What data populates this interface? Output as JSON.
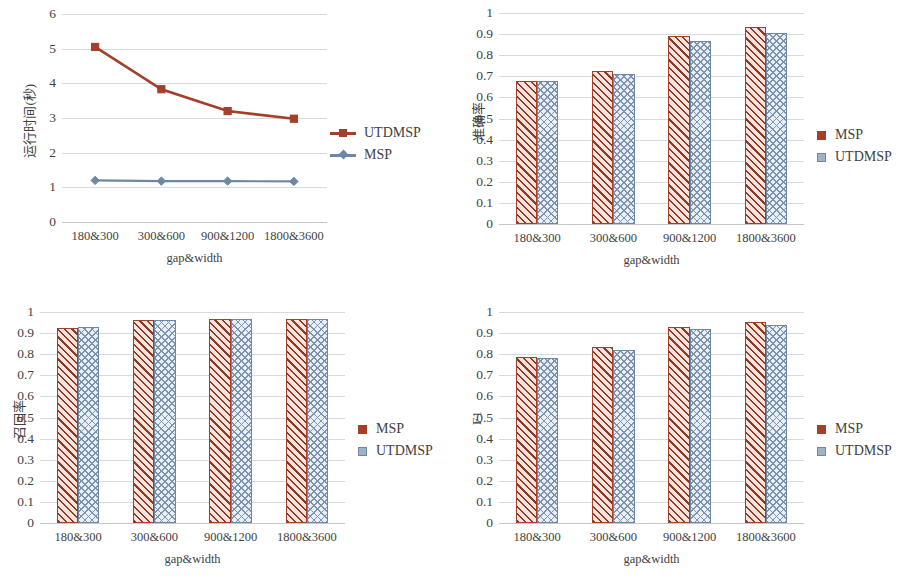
{
  "colors": {
    "msp_line": "#a33f2a",
    "msp_fill": "#f6e3dd",
    "utdmsp_line": "#6f87a3",
    "utdmsp_fill": "#e9eff7",
    "gridline": "#d6d9de",
    "text": "#3f3f3f"
  },
  "shared": {
    "categories": [
      "180&300",
      "300&600",
      "900&1200",
      "1800&3600"
    ],
    "xlabel": "gap&width",
    "series_names": {
      "msp": "MSP",
      "utdmsp": "UTDMSP"
    }
  },
  "charts": [
    {
      "id": "runtime",
      "type": "line",
      "title": "",
      "ylabel": "运行时间(秒)",
      "xlabel": "gap&width",
      "categories": [
        "180&300",
        "300&600",
        "900&1200",
        "1800&3600"
      ],
      "yticks": [
        "0",
        "1",
        "2",
        "3",
        "4",
        "5",
        "6"
      ],
      "ylim": [
        0,
        6
      ],
      "grid": true,
      "legend_position": "right",
      "series": [
        {
          "name": "UTDMSP",
          "color": "#a33f2a",
          "marker": "square",
          "values": [
            5.05,
            3.83,
            3.2,
            2.98
          ]
        },
        {
          "name": "MSP",
          "color": "#6f87a3",
          "marker": "diamond",
          "values": [
            1.2,
            1.18,
            1.18,
            1.17
          ]
        }
      ]
    },
    {
      "id": "precision",
      "type": "bar",
      "title": "",
      "ylabel": "准确率",
      "xlabel": "gap&width",
      "categories": [
        "180&300",
        "300&600",
        "900&1200",
        "1800&3600"
      ],
      "yticks": [
        "0",
        "0.1",
        "0.2",
        "0.3",
        "0.4",
        "0.5",
        "0.6",
        "0.7",
        "0.8",
        "0.9",
        "1"
      ],
      "ylim": [
        0,
        1
      ],
      "grid": true,
      "legend_position": "right",
      "series": [
        {
          "name": "MSP",
          "color": "#a33f2a",
          "pattern": "diagonal-hatch",
          "values": [
            0.68,
            0.723,
            0.889,
            0.935
          ]
        },
        {
          "name": "UTDMSP",
          "color": "#6f87a3",
          "pattern": "cross-hatch",
          "values": [
            0.676,
            0.71,
            0.866,
            0.905
          ]
        }
      ]
    },
    {
      "id": "recall",
      "type": "bar",
      "title": "",
      "ylabel": "召回率",
      "xlabel": "gap&width",
      "categories": [
        "180&300",
        "300&600",
        "900&1200",
        "1800&3600"
      ],
      "yticks": [
        "0",
        "0.1",
        "0.2",
        "0.3",
        "0.4",
        "0.5",
        "0.6",
        "0.7",
        "0.8",
        "0.9",
        "1"
      ],
      "ylim": [
        0,
        1
      ],
      "grid": true,
      "legend_position": "right",
      "series": [
        {
          "name": "MSP",
          "color": "#a33f2a",
          "pattern": "diagonal-hatch",
          "values": [
            0.925,
            0.962,
            0.968,
            0.966
          ]
        },
        {
          "name": "UTDMSP",
          "color": "#6f87a3",
          "pattern": "cross-hatch",
          "values": [
            0.927,
            0.961,
            0.967,
            0.966
          ]
        }
      ]
    },
    {
      "id": "f1",
      "type": "bar",
      "title": "",
      "ylabel": "F1",
      "xlabel": "gap&width",
      "categories": [
        "180&300",
        "300&600",
        "900&1200",
        "1800&3600"
      ],
      "yticks": [
        "0",
        "0.1",
        "0.2",
        "0.3",
        "0.4",
        "0.5",
        "0.6",
        "0.7",
        "0.8",
        "0.9",
        "1"
      ],
      "ylim": [
        0,
        1
      ],
      "grid": true,
      "legend_position": "right",
      "series": [
        {
          "name": "MSP",
          "color": "#a33f2a",
          "pattern": "diagonal-hatch",
          "values": [
            0.785,
            0.834,
            0.929,
            0.954
          ]
        },
        {
          "name": "UTDMSP",
          "color": "#6f87a3",
          "pattern": "cross-hatch",
          "values": [
            0.781,
            0.821,
            0.918,
            0.938
          ]
        }
      ]
    }
  ],
  "chart_data": [
    {
      "type": "line",
      "title": "运行时间(秒) vs gap&width",
      "xlabel": "gap&width",
      "ylabel": "运行时间(秒)",
      "categories": [
        "180&300",
        "300&600",
        "900&1200",
        "1800&3600"
      ],
      "ylim": [
        0,
        6
      ],
      "yticks": [
        0,
        1,
        2,
        3,
        4,
        5,
        6
      ],
      "grid": true,
      "legend": [
        "UTDMSP",
        "MSP"
      ],
      "legend_position": "right",
      "series": [
        {
          "name": "UTDMSP",
          "values": [
            5.05,
            3.83,
            3.2,
            2.98
          ]
        },
        {
          "name": "MSP",
          "values": [
            1.2,
            1.18,
            1.18,
            1.17
          ]
        }
      ]
    },
    {
      "type": "bar",
      "title": "准确率 vs gap&width",
      "xlabel": "gap&width",
      "ylabel": "准确率",
      "categories": [
        "180&300",
        "300&600",
        "900&1200",
        "1800&3600"
      ],
      "ylim": [
        0,
        1
      ],
      "yticks": [
        0,
        0.1,
        0.2,
        0.3,
        0.4,
        0.5,
        0.6,
        0.7,
        0.8,
        0.9,
        1
      ],
      "grid": true,
      "legend": [
        "MSP",
        "UTDMSP"
      ],
      "legend_position": "right",
      "series": [
        {
          "name": "MSP",
          "values": [
            0.68,
            0.723,
            0.889,
            0.935
          ]
        },
        {
          "name": "UTDMSP",
          "values": [
            0.676,
            0.71,
            0.866,
            0.905
          ]
        }
      ]
    },
    {
      "type": "bar",
      "title": "召回率 vs gap&width",
      "xlabel": "gap&width",
      "ylabel": "召回率",
      "categories": [
        "180&300",
        "300&600",
        "900&1200",
        "1800&3600"
      ],
      "ylim": [
        0,
        1
      ],
      "yticks": [
        0,
        0.1,
        0.2,
        0.3,
        0.4,
        0.5,
        0.6,
        0.7,
        0.8,
        0.9,
        1
      ],
      "grid": true,
      "legend": [
        "MSP",
        "UTDMSP"
      ],
      "legend_position": "right",
      "series": [
        {
          "name": "MSP",
          "values": [
            0.925,
            0.962,
            0.968,
            0.966
          ]
        },
        {
          "name": "UTDMSP",
          "values": [
            0.927,
            0.961,
            0.967,
            0.966
          ]
        }
      ]
    },
    {
      "type": "bar",
      "title": "F1 vs gap&width",
      "xlabel": "gap&width",
      "ylabel": "F1",
      "categories": [
        "180&300",
        "300&600",
        "900&1200",
        "1800&3600"
      ],
      "ylim": [
        0,
        1
      ],
      "yticks": [
        0,
        0.1,
        0.2,
        0.3,
        0.4,
        0.5,
        0.6,
        0.7,
        0.8,
        0.9,
        1
      ],
      "grid": true,
      "legend": [
        "MSP",
        "UTDMSP"
      ],
      "legend_position": "right",
      "series": [
        {
          "name": "MSP",
          "values": [
            0.785,
            0.834,
            0.929,
            0.954
          ]
        },
        {
          "name": "UTDMSP",
          "values": [
            0.781,
            0.821,
            0.918,
            0.938
          ]
        }
      ]
    }
  ]
}
